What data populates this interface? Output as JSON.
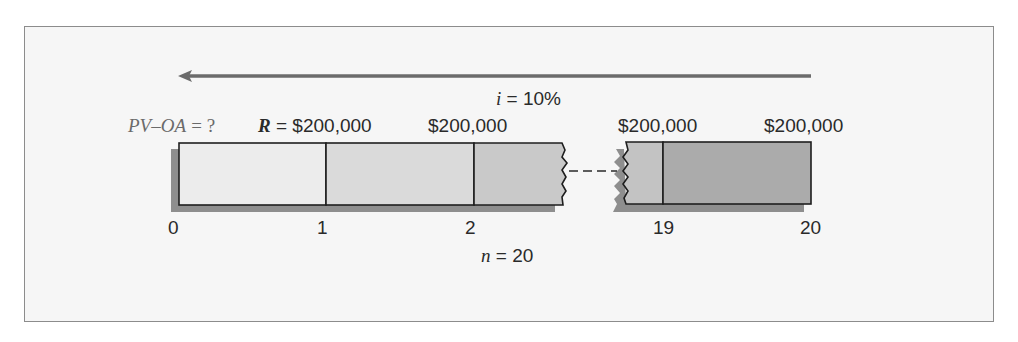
{
  "diagram": {
    "type": "annuity-timeline",
    "arrow_direction": "left",
    "interest": {
      "symbol": "i",
      "eq": "=",
      "value": "10%"
    },
    "unknown": {
      "symbol": "PV–OA",
      "eq": "= ?"
    },
    "payment": {
      "symbol": "R",
      "eq": "="
    },
    "payments": [
      "$200,000",
      "$200,000",
      "$200,000",
      "$200,000"
    ],
    "periods": {
      "symbol": "n",
      "eq": "=",
      "value": "20"
    },
    "ticks": [
      "0",
      "1",
      "2",
      "19",
      "20"
    ],
    "colors": {
      "frame_border": "#8c8c8c",
      "frame_bg": "#f6f6f6",
      "arrow": "#6b6b6b",
      "shadow": "#8e8e8e",
      "segment_1": "#ececec",
      "segment_2": "#dadada",
      "segment_3": "#c9c9c9",
      "segment_19": "#c3c3c3",
      "segment_20": "#ababab",
      "outline": "#1e1e1e"
    }
  }
}
